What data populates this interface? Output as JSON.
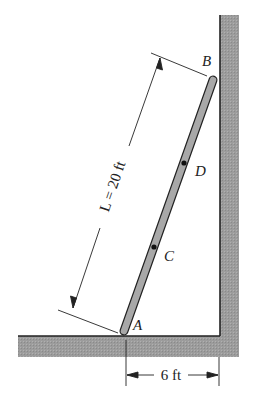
{
  "diagram": {
    "points": {
      "A": {
        "label": "A"
      },
      "B": {
        "label": "B"
      },
      "C": {
        "label": "C"
      },
      "D": {
        "label": "D"
      }
    },
    "dimensions": {
      "length": {
        "label": "L = 20 ft",
        "symbol": "L",
        "value": "20 ft"
      },
      "base": {
        "label": "6 ft",
        "value": "6 ft"
      }
    },
    "colors": {
      "ground": "#9a9a9a",
      "ladder": "#a8a8a8",
      "line": "#222222",
      "background": "#ffffff"
    }
  }
}
